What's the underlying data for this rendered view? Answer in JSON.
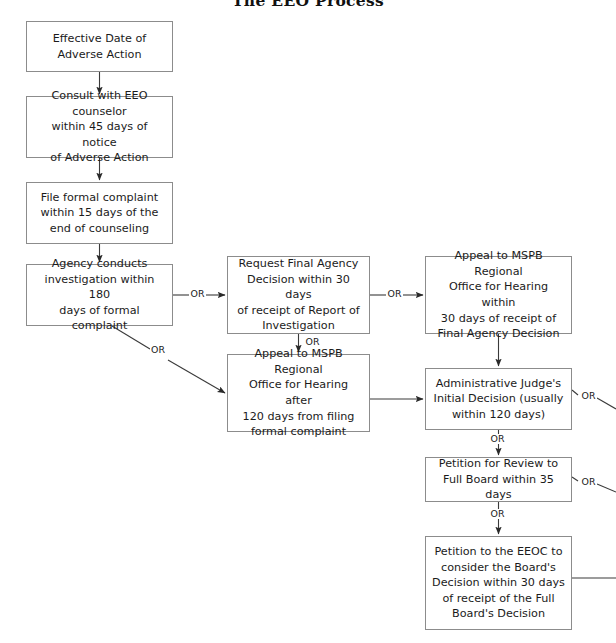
{
  "document": {
    "title": "The EEO Process",
    "background_color": "#ffffff",
    "border_color": "#8c8c8c",
    "line_color": "#3a3a3a",
    "text_color": "#1b1b1b"
  },
  "nodes": [
    {
      "id": "effective-date",
      "name": "node-effective-date-of-adverse-action",
      "text": "Effective Date of\nAdverse Action",
      "x": 26,
      "y": 21,
      "w": 147,
      "h": 51
    },
    {
      "id": "consult-eeo",
      "name": "node-consult-with-eeo-counselor",
      "text": "Consult with EEO counselor\nwithin 45 days of notice\nof Adverse Action",
      "x": 26,
      "y": 96,
      "w": 147,
      "h": 62
    },
    {
      "id": "file-complaint",
      "name": "node-file-formal-complaint",
      "text": "File formal complaint\nwithin 15 days of the\nend of counseling",
      "x": 26,
      "y": 182,
      "w": 147,
      "h": 62
    },
    {
      "id": "agency-investigation",
      "name": "node-agency-conducts-investigation",
      "text": "Agency conducts\ninvestigation within 180\ndays of formal complaint",
      "x": 26,
      "y": 264,
      "w": 147,
      "h": 62
    },
    {
      "id": "request-fad",
      "name": "node-request-final-agency-decision",
      "text": "Request Final Agency\nDecision within 30 days\nof receipt of Report of\nInvestigation",
      "x": 227,
      "y": 256,
      "w": 143,
      "h": 78
    },
    {
      "id": "appeal-mspb-120",
      "name": "node-appeal-to-mspb-after-120-days",
      "text": "Appeal to MSPB Regional\nOffice for Hearing after\n120 days from filing\nformal complaint",
      "x": 227,
      "y": 354,
      "w": 143,
      "h": 78
    },
    {
      "id": "appeal-mspb-30",
      "name": "node-appeal-to-mspb-within-30-days",
      "text": "Appeal to MSPB Regional\nOffice for Hearing within\n30 days of receipt of\nFinal Agency Decision",
      "x": 425,
      "y": 256,
      "w": 147,
      "h": 78
    },
    {
      "id": "admin-judge",
      "name": "node-administrative-judge-initial-decision",
      "text": "Administrative Judge's\nInitial Decision (usually\nwithin 120 days)",
      "x": 425,
      "y": 368,
      "w": 147,
      "h": 62
    },
    {
      "id": "petition-review",
      "name": "node-petition-for-review-full-board",
      "text": "Petition for Review to\nFull Board within 35 days",
      "x": 425,
      "y": 457,
      "w": 147,
      "h": 45
    },
    {
      "id": "petition-eeoc",
      "name": "node-petition-to-the-eeoc",
      "text": "Petition to the EEOC to\nconsider the Board's\nDecision within 30 days\nof receipt of the Full\nBoard's Decision",
      "x": 425,
      "y": 536,
      "w": 147,
      "h": 94
    }
  ],
  "or_labels": [
    {
      "name": "or-label-agency-to-request-fad",
      "text": "OR",
      "x": 191,
      "y": 289
    },
    {
      "name": "or-label-agency-to-appeal-120",
      "text": "OR",
      "x": 151,
      "y": 350
    },
    {
      "name": "or-label-request-fad-to-appeal-120",
      "text": "OR",
      "x": 303,
      "y": 337
    },
    {
      "name": "or-label-request-fad-to-appeal-30",
      "text": "OR",
      "x": 388,
      "y": 289
    },
    {
      "name": "or-label-admin-judge-right",
      "text": "OR",
      "x": 582,
      "y": 397
    },
    {
      "name": "or-label-admin-judge-to-petition-review",
      "text": "OR",
      "x": 489,
      "y": 437
    },
    {
      "name": "or-label-petition-review-right",
      "text": "OR",
      "x": 582,
      "y": 483
    },
    {
      "name": "or-label-petition-review-to-eeoc",
      "text": "OR",
      "x": 489,
      "y": 513
    }
  ],
  "connectors": [
    {
      "name": "connector-effective-date-to-consult",
      "kind": "arrow-down"
    },
    {
      "name": "connector-consult-to-file-complaint",
      "kind": "arrow-down"
    },
    {
      "name": "connector-file-complaint-to-agency",
      "kind": "arrow-down"
    },
    {
      "name": "connector-agency-to-request-fad",
      "kind": "arrow-right"
    },
    {
      "name": "connector-agency-to-appeal-120",
      "kind": "arrow-diagonal"
    },
    {
      "name": "connector-request-fad-to-appeal-120",
      "kind": "arrow-down"
    },
    {
      "name": "connector-request-fad-to-appeal-30",
      "kind": "arrow-right"
    },
    {
      "name": "connector-appeal-30-to-admin-judge",
      "kind": "arrow-down"
    },
    {
      "name": "connector-appeal-120-to-admin-judge",
      "kind": "arrow-right"
    },
    {
      "name": "connector-admin-judge-to-petition-review",
      "kind": "arrow-down"
    },
    {
      "name": "connector-petition-review-to-eeoc",
      "kind": "arrow-down"
    },
    {
      "name": "connector-admin-judge-offpage-right",
      "kind": "line-diagonal"
    },
    {
      "name": "connector-petition-review-offpage-right",
      "kind": "line-diagonal"
    },
    {
      "name": "connector-petition-eeoc-offpage-right",
      "kind": "line-right"
    }
  ]
}
